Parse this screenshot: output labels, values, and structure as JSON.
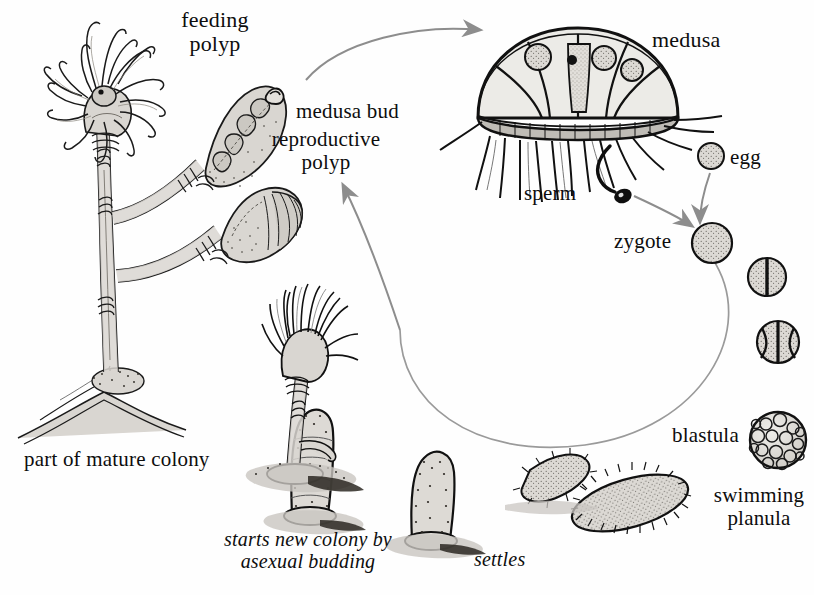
{
  "figure": {
    "kind": "biology-diagram",
    "background_color": "#fefefe",
    "ink_color": "#111111",
    "tissue_fill": "#d9d6d1",
    "arrow_color": "#8d8d8d",
    "shadow_color": "#c9c6c1"
  },
  "labels": {
    "feeding_polyp": "feeding\npolyp",
    "medusa_bud": "medusa bud",
    "reproductive_polyp": "reproductive\npolyp",
    "medusa": "medusa",
    "egg": "egg",
    "sperm": "sperm",
    "zygote": "zygote",
    "blastula": "blastula",
    "swimming_planula": "swimming\nplanula",
    "part_of_mature_colony": "part of mature colony",
    "starts_new_colony": "starts new colony by\nasexual budding",
    "settles": "settles"
  },
  "stages": [
    {
      "name": "feeding polyp",
      "label": "feeding polyp"
    },
    {
      "name": "reproductive polyp",
      "label": "reproductive polyp"
    },
    {
      "name": "medusa bud",
      "label": "medusa bud"
    },
    {
      "name": "medusa",
      "label": "medusa"
    },
    {
      "name": "egg",
      "label": "egg"
    },
    {
      "name": "sperm",
      "label": "sperm"
    },
    {
      "name": "zygote",
      "label": "zygote"
    },
    {
      "name": "two-cell stage",
      "label": ""
    },
    {
      "name": "four-cell stage",
      "label": ""
    },
    {
      "name": "blastula",
      "label": "blastula"
    },
    {
      "name": "swimming planula",
      "label": "swimming planula"
    },
    {
      "name": "settling planula",
      "label": "settles"
    },
    {
      "name": "young polyp",
      "label": ""
    },
    {
      "name": "new colony",
      "label": "starts new colony by asexual budding"
    }
  ],
  "arrows": [
    {
      "name": "polyp-to-medusa",
      "from": "reproductive polyp",
      "to": "medusa"
    },
    {
      "name": "egg-to-zygote",
      "from": "egg",
      "to": "zygote"
    },
    {
      "name": "sperm-to-zygote",
      "from": "sperm",
      "to": "zygote"
    },
    {
      "name": "cycle-loop",
      "from": "zygote",
      "to": "planula"
    },
    {
      "name": "newcolony-to-polyp",
      "from": "new colony",
      "to": "reproductive polyp"
    }
  ]
}
